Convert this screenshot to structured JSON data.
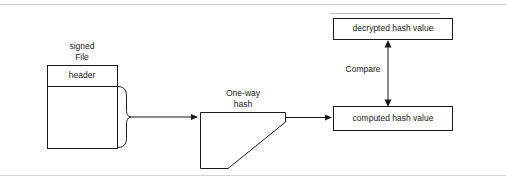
{
  "diagram": {
    "title_hidden": "",
    "nodes": {
      "signed_file_label_line1": "signed",
      "signed_file_label_line2": "File",
      "header_label": "header",
      "oneway_hash_label_line1": "One-way",
      "oneway_hash_label_line2": "hash",
      "decrypted_hash_value": "decrypted hash value",
      "computed_hash_value": "computed hash value",
      "compare_label": "Compare"
    },
    "colors": {
      "stroke": "#1b1b1b",
      "text": "#1b1b1b",
      "background": "#ffffff",
      "rule": "#c9c9c9"
    }
  }
}
